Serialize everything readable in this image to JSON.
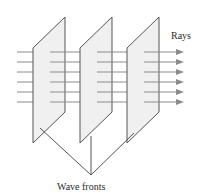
{
  "diagram": {
    "labels": {
      "rays": "Rays",
      "wave_fronts": "Wave fronts"
    },
    "wave_front_count": 3,
    "ray_count": 6,
    "colors": {
      "plane_fill": "#f0f0f0",
      "plane_stroke": "#555555",
      "ray": "#888888",
      "arrow": "#8a8a8a",
      "pointer": "#555555"
    }
  }
}
